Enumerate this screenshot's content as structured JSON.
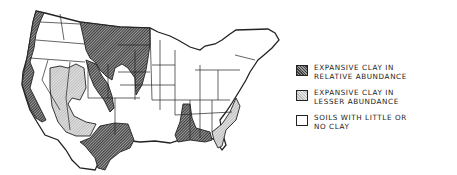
{
  "map": {
    "subject": "Contiguous United States",
    "regions": [
      {
        "name": "Pacific coast",
        "category": "relative_abundance"
      },
      {
        "name": "Northern Great Plains (Montana, Dakotas)",
        "category": "relative_abundance"
      },
      {
        "name": "Central Rockies / Colorado",
        "category": "relative_abundance"
      },
      {
        "name": "Texas",
        "category": "relative_abundance"
      },
      {
        "name": "Lower Mississippi valley",
        "category": "relative_abundance"
      },
      {
        "name": "Great Basin / Southwest",
        "category": "lesser_abundance"
      },
      {
        "name": "Southeast coastal plain",
        "category": "lesser_abundance"
      },
      {
        "name": "Eastern & Midwestern states",
        "category": "little_or_no_clay"
      }
    ],
    "colors": {
      "relative_abundance": "#6b6b6b",
      "lesser_abundance": "#d4d4d4",
      "little_or_no_clay": "#ffffff",
      "outline": "#222222"
    }
  },
  "legend": {
    "items": [
      {
        "key": "relative_abundance",
        "line1": "EXPANSIVE CLAY IN",
        "line2": "RELATIVE ABUNDANCE"
      },
      {
        "key": "lesser_abundance",
        "line1": "EXPANSIVE CLAY IN",
        "line2": "LESSER ABUNDANCE"
      },
      {
        "key": "little_or_no_clay",
        "line1": "SOILS WITH LITTLE OR",
        "line2": "NO CLAY"
      }
    ]
  }
}
